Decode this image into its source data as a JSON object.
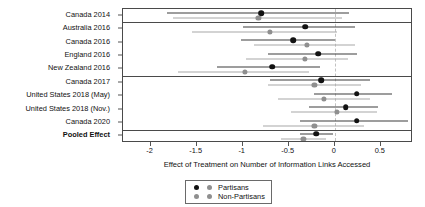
{
  "chart_data": {
    "type": "scatter",
    "subtype": "forest-plot",
    "title": "",
    "xlabel": "Effect of Treatment on Number of Information Links Accessed",
    "ylabel": "",
    "xlim": [
      -2.3,
      0.85
    ],
    "xticks": [
      -2,
      -1.5,
      -1,
      -0.5,
      0,
      0.5
    ],
    "xticklabels": [
      "-2",
      "-1.5",
      "-1",
      "-0.5",
      "0",
      "0.5"
    ],
    "grid": false,
    "reference_line": 0,
    "legend_position": "bottom",
    "legend": [
      "Partisans",
      "Non-Partisans"
    ],
    "colors": {
      "partisan": "#121212",
      "nonpartisan": "#8f8f8f",
      "reference_line": "#c2c2c2",
      "panel_border": "#4a4a4a"
    },
    "group_separators_after": [
      "Canada 2014",
      "New Zealand 2016",
      "Canada 2020"
    ],
    "categories": [
      "Canada 2014",
      "Australia 2016",
      "Canada 2016",
      "England 2016",
      "New Zealand 2016",
      "Canada 2017",
      "United States 2018 (May)",
      "United States 2018 (Nov.)",
      "Canada 2020",
      "Pooled Effect"
    ],
    "series": [
      {
        "name": "Partisans",
        "color": "#121212",
        "points": [
          {
            "category": "Canada 2014",
            "estimate": -0.8,
            "ci_low": -1.82,
            "ci_high": 0.15
          },
          {
            "category": "Australia 2016",
            "estimate": -0.32,
            "ci_low": -1.0,
            "ci_high": 0.22
          },
          {
            "category": "Canada 2016",
            "estimate": -0.45,
            "ci_low": -1.02,
            "ci_high": 0.0
          },
          {
            "category": "England 2016",
            "estimate": -0.18,
            "ci_low": -0.73,
            "ci_high": 0.24
          },
          {
            "category": "New Zealand 2016",
            "estimate": -0.68,
            "ci_low": -1.28,
            "ci_high": -0.16
          },
          {
            "category": "Canada 2017",
            "estimate": -0.15,
            "ci_low": -0.7,
            "ci_high": 0.38
          },
          {
            "category": "United States 2018 (May)",
            "estimate": 0.24,
            "ci_low": -0.22,
            "ci_high": 0.62
          },
          {
            "category": "United States 2018 (Nov.)",
            "estimate": 0.12,
            "ci_low": -0.28,
            "ci_high": 0.47
          },
          {
            "category": "Canada 2020",
            "estimate": 0.24,
            "ci_low": -0.38,
            "ci_high": 0.8
          },
          {
            "category": "Pooled Effect",
            "estimate": -0.2,
            "ci_low": -0.38,
            "ci_high": -0.02
          }
        ]
      },
      {
        "name": "Non-Partisans",
        "color": "#8f8f8f",
        "points": [
          {
            "category": "Canada 2014",
            "estimate": -0.83,
            "ci_low": -1.76,
            "ci_high": 0.08
          },
          {
            "category": "Australia 2016",
            "estimate": -0.7,
            "ci_low": -1.55,
            "ci_high": 0.02
          },
          {
            "category": "Canada 2016",
            "estimate": -0.3,
            "ci_low": -0.88,
            "ci_high": 0.22
          },
          {
            "category": "England 2016",
            "estimate": -0.32,
            "ci_low": -0.96,
            "ci_high": 0.14
          },
          {
            "category": "New Zealand 2016",
            "estimate": -0.98,
            "ci_low": -1.7,
            "ci_high": -0.28
          },
          {
            "category": "Canada 2017",
            "estimate": -0.22,
            "ci_low": -0.72,
            "ci_high": 0.28
          },
          {
            "category": "United States 2018 (May)",
            "estimate": -0.12,
            "ci_low": -0.62,
            "ci_high": 0.38
          },
          {
            "category": "United States 2018 (Nov.)",
            "estimate": 0.02,
            "ci_low": -0.48,
            "ci_high": 0.46
          },
          {
            "category": "Canada 2020",
            "estimate": -0.22,
            "ci_low": -0.78,
            "ci_high": 0.32
          },
          {
            "category": "Pooled Effect",
            "estimate": -0.34,
            "ci_low": -0.58,
            "ci_high": -0.1
          }
        ]
      }
    ]
  }
}
